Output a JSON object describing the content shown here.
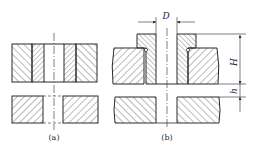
{
  "figure": {
    "type": "engineering cross-section drawing",
    "line_color": "#2a2a2a",
    "background": "#ffffff"
  },
  "panels": [
    {
      "id": "a",
      "caption": "(a)",
      "description": "Flush bushing pressed into plate, workpiece below"
    },
    {
      "id": "b",
      "caption": "(b)",
      "description": "Headed (collared) bushing in plate with dimensions",
      "dimensions": [
        {
          "symbol": "D",
          "meaning": "bore diameter"
        },
        {
          "symbol": "H",
          "meaning": "bushing height"
        },
        {
          "symbol": "h",
          "meaning": "clearance gap"
        }
      ]
    }
  ]
}
